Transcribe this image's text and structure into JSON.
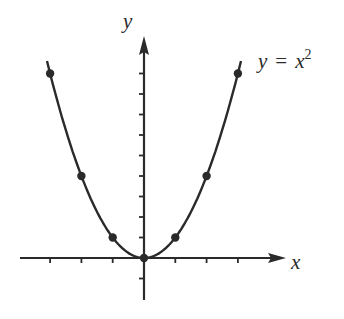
{
  "equation": {
    "lhs": "y",
    "eq": "=",
    "base": "x",
    "exp": "2"
  },
  "axes": {
    "x_label": "x",
    "y_label": "y",
    "origin_px": [
      144,
      258
    ],
    "x_unit_px": 31.3,
    "y_unit_px": 20.5,
    "x_ticks": [
      -3,
      -2,
      -1,
      1,
      2,
      3
    ],
    "y_ticks": [
      -1,
      1,
      2,
      3,
      4,
      5,
      6,
      7,
      8,
      9
    ]
  },
  "colors": {
    "ink": "#2a2a2a",
    "background": "#ffffff"
  },
  "chart_data": {
    "type": "line",
    "xlabel": "x",
    "ylabel": "y",
    "series": [
      {
        "name": "y = x^2",
        "x": [
          -3.1,
          -2,
          -1,
          0,
          1,
          2,
          3.1
        ],
        "y": [
          9.61,
          4,
          1,
          0,
          1,
          4,
          9.61
        ]
      }
    ],
    "points": [
      [
        -3,
        9
      ],
      [
        -2,
        4
      ],
      [
        -1,
        1
      ],
      [
        0,
        0
      ],
      [
        1,
        1
      ],
      [
        2,
        4
      ],
      [
        3,
        9
      ]
    ],
    "xlim": [
      -4,
      4.4
    ],
    "ylim": [
      -2,
      10.5
    ],
    "grid": false
  }
}
